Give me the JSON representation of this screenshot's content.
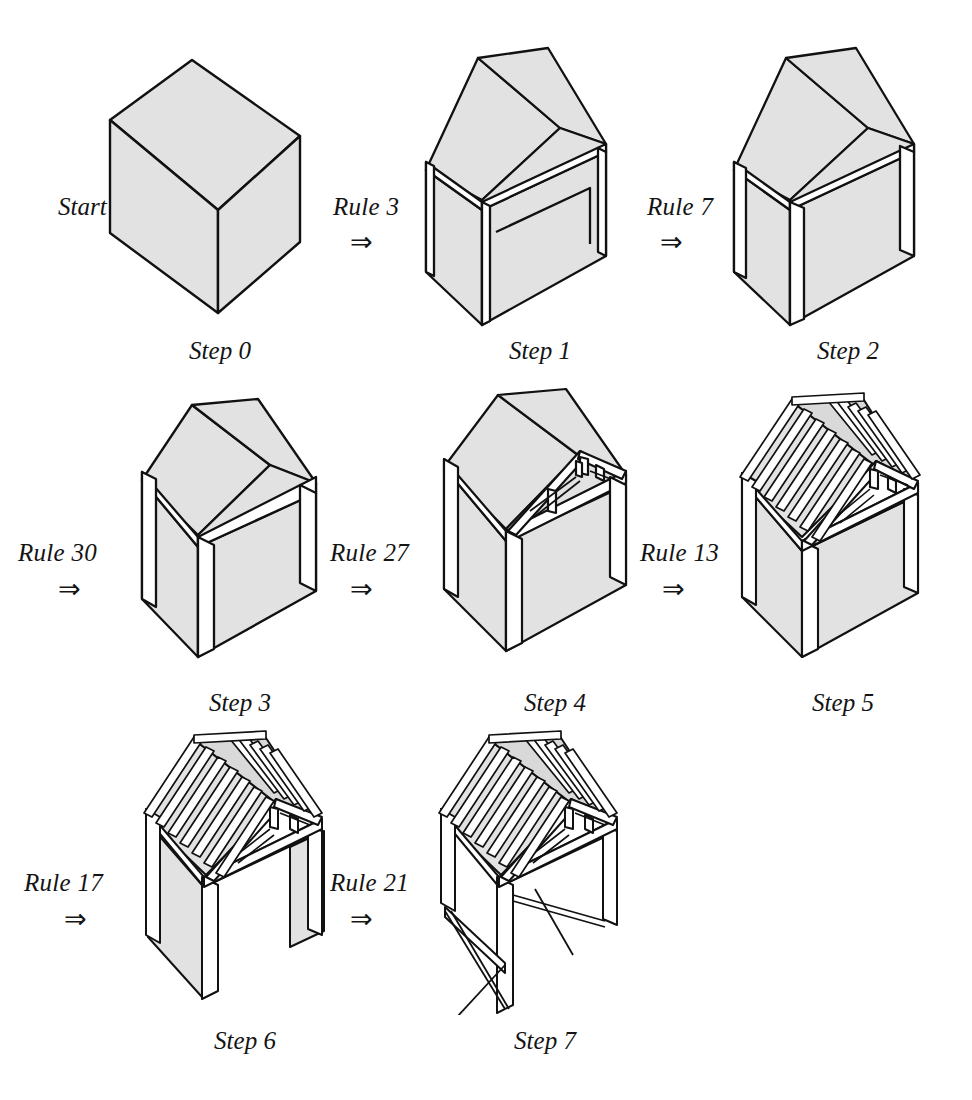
{
  "figure": {
    "kind": "shape-grammar-derivation",
    "start_label": "Start",
    "arrow_glyph": "⇒",
    "colors": {
      "background": "#ffffff",
      "surface_fill": "#e2e2e2",
      "surface_fill_dark": "#cfcfcf",
      "timber_fill": "#ffffff",
      "outline": "#111111"
    },
    "steps": [
      {
        "id": "step0",
        "caption": "Step 0",
        "rule": null,
        "arrow": null,
        "description": "solid rectangular block"
      },
      {
        "id": "step1",
        "caption": "Step 1",
        "rule": "Rule 3",
        "arrow": "⇒",
        "description": "block with gabled roof added"
      },
      {
        "id": "step2",
        "caption": "Step 2",
        "rule": "Rule 7",
        "arrow": "⇒",
        "description": "gabled block with wall plate and corner post lines"
      },
      {
        "id": "step3",
        "caption": "Step 3",
        "rule": "Rule 30",
        "arrow": "⇒",
        "description": "gabled block with eaves beam and posts"
      },
      {
        "id": "step4",
        "caption": "Step 4",
        "rule": "Rule 27",
        "arrow": "⇒",
        "description": "roof truss revealed at front gable"
      },
      {
        "id": "step5",
        "caption": "Step 5",
        "rule": "Rule 13",
        "arrow": "⇒",
        "description": "rafters added across the roof"
      },
      {
        "id": "step6",
        "caption": "Step 6",
        "rule": "Rule 17",
        "arrow": "⇒",
        "description": "walls opened, posts and braces exposed"
      },
      {
        "id": "step7",
        "caption": "Step 7",
        "rule": "Rule 21",
        "arrow": "⇒",
        "description": "complete open timber frame with cross bracing"
      }
    ],
    "rows": [
      [
        "step0",
        "step1",
        "step2"
      ],
      [
        "step3",
        "step4",
        "step5"
      ],
      [
        "step6",
        "step7"
      ]
    ]
  }
}
